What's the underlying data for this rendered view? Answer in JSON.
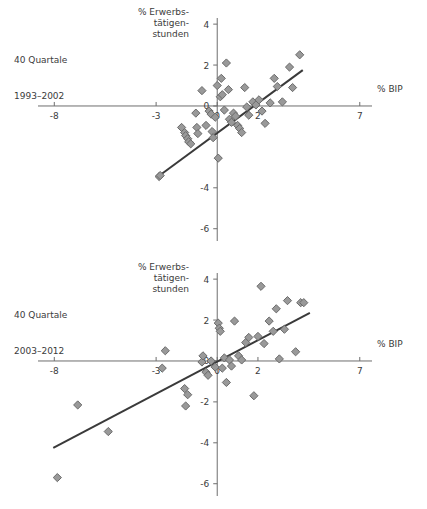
{
  "page": {
    "background": "#ffffff",
    "marker_fill": "#999999",
    "marker_stroke": "#6b6b6b",
    "axis_color": "#6e6e6e",
    "trend_color": "#3a3a3a",
    "text_color": "#3b3b3b"
  },
  "panels": [
    {
      "caption_line1": "40 Quartale",
      "caption_line2": "1993–2002",
      "ylabel_l1": "% Erwerbs-",
      "ylabel_l2": "tätigen-",
      "ylabel_l3": "stunden",
      "xlabel": "% BIP",
      "xticks": [
        "-8",
        "-3",
        "0",
        "2",
        "7"
      ],
      "yticks": [
        "4",
        "2",
        "0",
        "-4",
        "-6"
      ]
    },
    {
      "caption_line1": "40 Quartale",
      "caption_line2": "2003–2012",
      "ylabel_l1": "% Erwerbs-",
      "ylabel_l2": "tätigen-",
      "ylabel_l3": "stunden",
      "xlabel": "% BIP",
      "xticks": [
        "-8",
        "-3",
        "0",
        "2",
        "7"
      ],
      "yticks": [
        "4",
        "2",
        "0",
        "-2",
        "-4",
        "-6"
      ]
    }
  ],
  "chart_data": [
    {
      "type": "scatter",
      "title": "40 Quartale 1993–2002",
      "xlabel": "% BIP",
      "ylabel": "% Erwerbstätigenstunden",
      "xlim": [
        -8.8,
        7.6
      ],
      "ylim": [
        -6.6,
        4.3
      ],
      "xticks": [
        -8,
        -3,
        0,
        2,
        7
      ],
      "yticks": [
        4,
        2,
        0,
        -4,
        -6
      ],
      "grid": false,
      "legend": "none",
      "points": [
        [
          -2.85,
          -3.45
        ],
        [
          -2.8,
          -3.4
        ],
        [
          -1.75,
          -1.05
        ],
        [
          -1.6,
          -1.3
        ],
        [
          -1.55,
          -1.45
        ],
        [
          -1.45,
          -1.6
        ],
        [
          -1.4,
          -1.75
        ],
        [
          -1.3,
          -1.85
        ],
        [
          -1.05,
          -0.35
        ],
        [
          -1.0,
          -1.05
        ],
        [
          -0.95,
          -1.35
        ],
        [
          -0.75,
          0.75
        ],
        [
          -0.55,
          -0.95
        ],
        [
          -0.4,
          -0.25
        ],
        [
          -0.3,
          -0.4
        ],
        [
          -0.25,
          -1.25
        ],
        [
          -0.2,
          -1.55
        ],
        [
          -0.1,
          -0.55
        ],
        [
          0.0,
          1.0
        ],
        [
          0.05,
          -2.55
        ],
        [
          0.15,
          0.45
        ],
        [
          0.2,
          1.35
        ],
        [
          0.25,
          0.55
        ],
        [
          0.35,
          -0.2
        ],
        [
          0.45,
          2.1
        ],
        [
          0.55,
          0.8
        ],
        [
          0.6,
          -0.65
        ],
        [
          0.7,
          -0.8
        ],
        [
          0.8,
          -0.35
        ],
        [
          0.9,
          -0.5
        ],
        [
          1.0,
          -0.95
        ],
        [
          1.1,
          -1.1
        ],
        [
          1.2,
          -1.3
        ],
        [
          1.35,
          0.9
        ],
        [
          1.45,
          -0.05
        ],
        [
          1.55,
          -0.45
        ],
        [
          1.75,
          0.2
        ],
        [
          1.9,
          0.05
        ],
        [
          2.05,
          0.3
        ],
        [
          2.2,
          -0.25
        ],
        [
          2.35,
          -0.85
        ],
        [
          2.6,
          0.15
        ],
        [
          2.8,
          1.35
        ],
        [
          2.95,
          0.95
        ],
        [
          3.2,
          0.2
        ],
        [
          3.55,
          1.9
        ],
        [
          3.7,
          0.9
        ],
        [
          4.05,
          2.5
        ]
      ],
      "trendline": {
        "x": [
          -2.9,
          4.2
        ],
        "y": [
          -3.45,
          1.75
        ]
      }
    },
    {
      "type": "scatter",
      "title": "40 Quartale 2003–2012",
      "xlabel": "% BIP",
      "ylabel": "% Erwerbstätigenstunden",
      "xlim": [
        -8.8,
        7.6
      ],
      "ylim": [
        -6.6,
        4.3
      ],
      "xticks": [
        -8,
        -3,
        0,
        2,
        7
      ],
      "yticks": [
        4,
        2,
        0,
        -2,
        -4,
        -6
      ],
      "grid": false,
      "legend": "none",
      "points": [
        [
          -7.85,
          -5.7
        ],
        [
          -6.85,
          -2.15
        ],
        [
          -5.35,
          -3.45
        ],
        [
          -2.55,
          0.5
        ],
        [
          -2.7,
          -0.35
        ],
        [
          -1.6,
          -1.35
        ],
        [
          -1.45,
          -1.65
        ],
        [
          -1.55,
          -2.2
        ],
        [
          -0.75,
          -0.05
        ],
        [
          -0.7,
          0.25
        ],
        [
          -0.55,
          -0.55
        ],
        [
          -0.45,
          -0.7
        ],
        [
          -0.3,
          0.0
        ],
        [
          -0.1,
          -0.3
        ],
        [
          0.05,
          1.85
        ],
        [
          0.1,
          1.6
        ],
        [
          0.15,
          1.45
        ],
        [
          0.25,
          -0.35
        ],
        [
          0.35,
          0.15
        ],
        [
          0.45,
          -1.05
        ],
        [
          0.6,
          0.05
        ],
        [
          0.7,
          -0.25
        ],
        [
          0.85,
          1.95
        ],
        [
          1.05,
          0.25
        ],
        [
          1.2,
          0.05
        ],
        [
          1.4,
          0.9
        ],
        [
          1.55,
          1.15
        ],
        [
          1.8,
          -1.7
        ],
        [
          2.0,
          1.2
        ],
        [
          2.15,
          3.65
        ],
        [
          2.3,
          0.85
        ],
        [
          2.55,
          1.95
        ],
        [
          2.75,
          1.45
        ],
        [
          2.9,
          2.55
        ],
        [
          3.05,
          0.1
        ],
        [
          3.3,
          1.55
        ],
        [
          3.45,
          2.95
        ],
        [
          3.85,
          0.45
        ],
        [
          4.1,
          2.85
        ],
        [
          4.25,
          2.85
        ]
      ],
      "trendline": {
        "x": [
          -8.05,
          4.55
        ],
        "y": [
          -4.25,
          2.35
        ]
      }
    }
  ]
}
